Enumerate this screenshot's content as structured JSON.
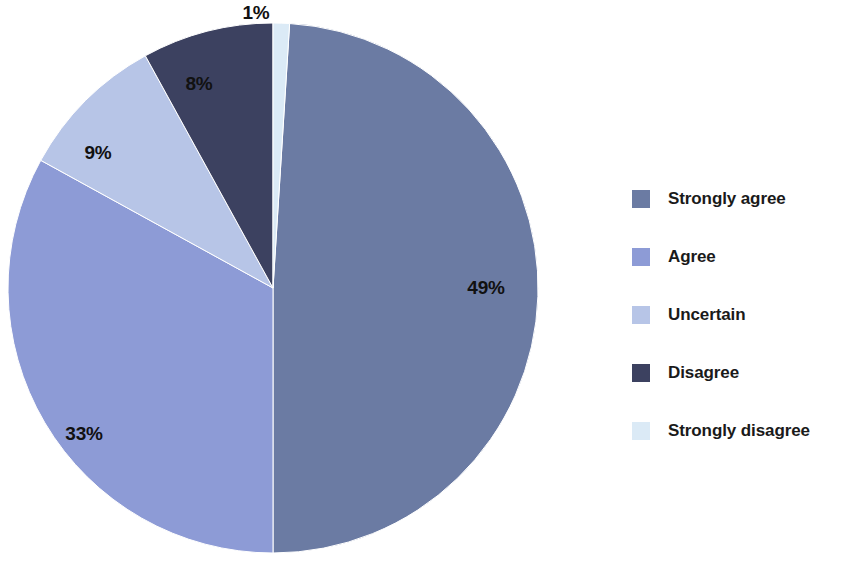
{
  "chart_data": {
    "type": "pie",
    "title": "",
    "subtitle": "",
    "xlabel": "",
    "ylabel": "",
    "legend_position": "right",
    "grid": false,
    "unit": "%",
    "categories": [
      "Strongly agree",
      "Agree",
      "Uncertain",
      "Disagree",
      "Strongly disagree"
    ],
    "values": [
      49,
      33,
      9,
      8,
      1
    ],
    "data_labels": [
      "49%",
      "33%",
      "9%",
      "8%",
      "1%"
    ],
    "colors": [
      "#6b7ba3",
      "#8d9bd6",
      "#b7c5e7",
      "#3c4160",
      "#dbeaf6"
    ],
    "slices": [
      {
        "label": "Strongly agree",
        "value": 49,
        "data_label": "49%",
        "color": "#6b7ba3",
        "start_angle": 3.6,
        "end_angle": 180.0,
        "label_x": 486,
        "label_y": 288
      },
      {
        "label": "Agree",
        "value": 33,
        "data_label": "33%",
        "color": "#8d9bd6",
        "start_angle": 180.0,
        "end_angle": 298.8,
        "label_x": 84,
        "label_y": 434
      },
      {
        "label": "Uncertain",
        "value": 9,
        "data_label": "9%",
        "color": "#b7c5e7",
        "start_angle": 298.8,
        "end_angle": 331.2,
        "label_x": 98,
        "label_y": 153
      },
      {
        "label": "Disagree",
        "value": 8,
        "data_label": "8%",
        "color": "#3c4160",
        "start_angle": 331.2,
        "end_angle": 360.0,
        "label_x": 199,
        "label_y": 84
      },
      {
        "label": "Strongly disagree",
        "value": 1,
        "data_label": "1%",
        "color": "#dbeaf6",
        "start_angle": 0.0,
        "end_angle": 3.6,
        "label_x": 256,
        "label_y": 13
      }
    ]
  },
  "legend": {
    "items": [
      {
        "label": "Strongly agree",
        "color": "#6b7ba3"
      },
      {
        "label": "Agree",
        "color": "#8d9bd6"
      },
      {
        "label": "Uncertain",
        "color": "#b7c5e7"
      },
      {
        "label": "Disagree",
        "color": "#3c4160"
      },
      {
        "label": "Strongly disagree",
        "color": "#dbeaf6"
      }
    ]
  }
}
